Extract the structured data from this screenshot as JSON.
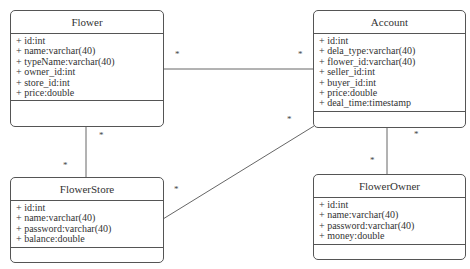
{
  "classes": {
    "flower": {
      "name": "Flower",
      "attributes": [
        "+ id:int",
        "+ name:varchar(40)",
        "+ typeName:varchar(40)",
        "+ owner_id:int",
        "+ store_id:int",
        "+ price:double"
      ]
    },
    "account": {
      "name": "Account",
      "attributes": [
        "+ id:int",
        "+ dela_type:varchar(40)",
        "+ flower_id:varchar(40)",
        "+ seller_id:int",
        "+ buyer_id:int",
        "+ price:double",
        "+ deal_time:timestamp"
      ]
    },
    "flowerStore": {
      "name": "FlowerStore",
      "attributes": [
        "+ id:int",
        "+ name:varchar(40)",
        "+ password:varchar(40)",
        "+ balance:double"
      ]
    },
    "flowerOwner": {
      "name": "FlowerOwner",
      "attributes": [
        "+ id:int",
        "+ name:varchar(40)",
        "+ password:varchar(40)",
        "+ money:double"
      ]
    }
  },
  "associations": [
    {
      "from": "Flower",
      "to": "Account",
      "from_mult": "*",
      "to_mult": "*"
    },
    {
      "from": "Flower",
      "to": "FlowerStore",
      "from_mult": "*",
      "to_mult": "*"
    },
    {
      "from": "FlowerStore",
      "to": "Account",
      "from_mult": "*",
      "to_mult": "*"
    },
    {
      "from": "Account",
      "to": "FlowerOwner",
      "from_mult": "*",
      "to_mult": "*"
    }
  ],
  "colors": {
    "line": "#555555",
    "text": "#333333",
    "background": "#ffffff"
  }
}
